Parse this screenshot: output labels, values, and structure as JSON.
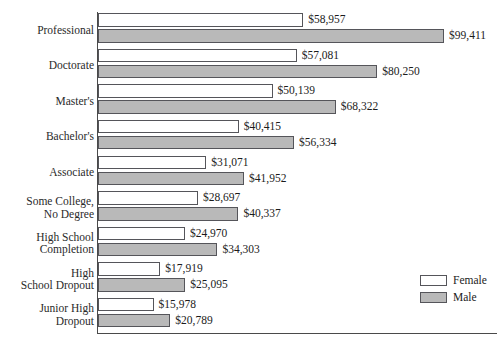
{
  "chart_data": {
    "type": "bar",
    "orientation": "horizontal",
    "title": "",
    "subtitle": "",
    "xlabel": "",
    "ylabel": "",
    "grid": false,
    "legend_position": "bottom-right",
    "xlim": [
      0,
      99411
    ],
    "categories": [
      "Professional",
      "Doctorate",
      "Master's",
      "Bachelor's",
      "Associate",
      "Some College,\nNo Degree",
      "High School\nCompletion",
      "High\nSchool Dropout",
      "Junior High\nDropout"
    ],
    "series": [
      {
        "name": "Female",
        "color": "#ffffff",
        "values": [
          58957,
          57081,
          50139,
          40415,
          31071,
          28697,
          24970,
          17919,
          15978
        ],
        "labels": [
          "$58,957",
          "$57,081",
          "$50,139",
          "$40,415",
          "$31,071",
          "$28,697",
          "$24,970",
          "$17,919",
          "$15,978"
        ]
      },
      {
        "name": "Male",
        "color": "#b9b9b9",
        "values": [
          99411,
          80250,
          68322,
          56334,
          41952,
          40337,
          34303,
          25095,
          20789
        ],
        "labels": [
          "$99,411",
          "$80,250",
          "$68,322",
          "$56,334",
          "$41,952",
          "$40,337",
          "$34,303",
          "$25,095",
          "$20,789"
        ]
      }
    ]
  },
  "legend": {
    "items": [
      {
        "label": "Female",
        "color": "#ffffff"
      },
      {
        "label": "Male",
        "color": "#b9b9b9"
      }
    ]
  }
}
